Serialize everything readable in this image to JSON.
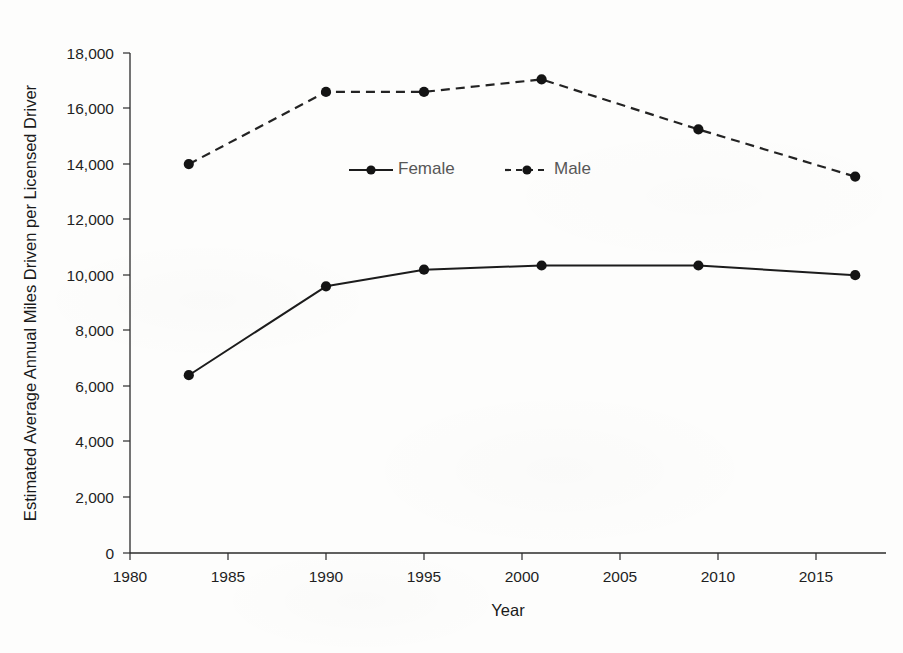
{
  "chart_data": {
    "type": "line",
    "title": "",
    "xlabel": "Year",
    "ylabel": "Estimated Average Annual Miles Driven per Licensed Driver",
    "xlim": [
      1980,
      2018.5
    ],
    "ylim": [
      0,
      18000
    ],
    "grid": false,
    "legend_position": "upper-center-inside",
    "x": [
      1983,
      1990,
      1995,
      2001,
      2009,
      2017
    ],
    "series": [
      {
        "name": "Female",
        "line_style": "solid",
        "marker": "filled-circle",
        "color": "#1c1c1c",
        "values": [
          6400,
          9600,
          10200,
          10350,
          10350,
          10000
        ]
      },
      {
        "name": "Male",
        "line_style": "dashed",
        "marker": "filled-circle",
        "color": "#232323",
        "values": [
          14000,
          16600,
          16600,
          17050,
          15250,
          13550
        ]
      }
    ],
    "xticks": [
      1980,
      1985,
      1990,
      1995,
      2000,
      2005,
      2010,
      2015
    ],
    "xtick_labels": [
      "1980",
      "1985",
      "1990",
      "1995",
      "2000",
      "2005",
      "2010",
      "2015"
    ],
    "yticks": [
      0,
      2000,
      4000,
      6000,
      8000,
      10000,
      12000,
      14000,
      16000,
      18000
    ],
    "ytick_labels": [
      "0",
      "2,000",
      "4,000",
      "6,000",
      "8,000",
      "10,000",
      "12,000",
      "14,000",
      "16,000",
      "18,000"
    ],
    "legend": [
      {
        "label": "Female",
        "line_style": "solid"
      },
      {
        "label": "Male",
        "line_style": "dashed"
      }
    ]
  },
  "colors": {
    "axis": "#2b2b2b",
    "text": "#1a1a1a",
    "legend_text": "#575757",
    "background": "#fdfdfc"
  }
}
